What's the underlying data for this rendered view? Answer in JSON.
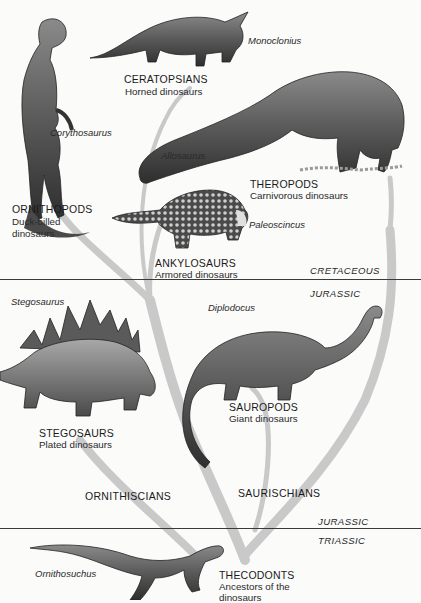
{
  "diagram": {
    "type": "evolutionary-tree",
    "colors": {
      "background": "#fbfbfa",
      "branch": "#c9c9c9",
      "divider": "#3a3a3a",
      "text": "#1a1a1a"
    },
    "periods": {
      "cretaceous": "CRETACEOUS",
      "jurassic_upper": "JURASSIC",
      "jurassic_lower": "JURASSIC",
      "triassic": "TRIASSIC"
    },
    "clades": {
      "ornithiscians": "ORNITHISCIANS",
      "saurischians": "SAURISCHIANS"
    },
    "groups": {
      "ceratopsians": {
        "name": "CERATOPSIANS",
        "desc": "Horned dinosaurs",
        "genus": "Monoclonius"
      },
      "ornithopods": {
        "name": "ORNITHOPODS",
        "desc1": "Duck-billed",
        "desc2": "dinosaurs",
        "genus": "Corythosaurus"
      },
      "theropods": {
        "name": "THEROPODS",
        "desc": "Carnivorous dinosaurs",
        "genus": "Allosaurus"
      },
      "ankylosaurs": {
        "name": "ANKYLOSAURS",
        "desc": "Armored dinosaurs",
        "genus": "Paleoscincus"
      },
      "stegosaurs": {
        "name": "STEGOSAURS",
        "desc": "Plated dinosaurs",
        "genus": "Stegosaurus"
      },
      "sauropods": {
        "name": "SAUROPODS",
        "desc": "Giant dinosaurs",
        "genus": "Diplodocus"
      },
      "thecodonts": {
        "name": "THECODONTS",
        "desc1": "Ancestors of the",
        "desc2": "dinosaurs",
        "genus": "Ornithosuchus"
      }
    }
  }
}
